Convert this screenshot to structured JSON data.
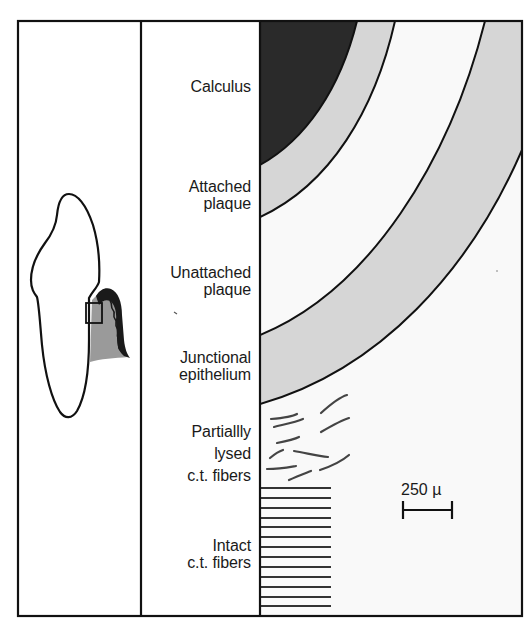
{
  "figure": {
    "layers": [
      {
        "id": "calculus",
        "lines": [
          "Calculus"
        ]
      },
      {
        "id": "attached-plaque",
        "lines": [
          "Attached",
          "plaque"
        ]
      },
      {
        "id": "unattached-plaque",
        "lines": [
          "Unattached",
          "plaque"
        ]
      },
      {
        "id": "junctional-epithelium",
        "lines": [
          "Junctional",
          "epithelium"
        ]
      },
      {
        "id": "partially-lysed-ct-fibers",
        "lines": [
          "Partiallly",
          "lysed",
          "c.t. fibers"
        ]
      },
      {
        "id": "intact-ct-fibers",
        "lines": [
          "Intact",
          "c.t. fibers"
        ]
      }
    ],
    "scale_bar": {
      "label": "250 µ"
    },
    "colors": {
      "calculus": "#2a2a2a",
      "plaque_gray": "#d6d6d6",
      "background": "#f9f9f9",
      "line": "#111111",
      "gingiva_gray": "#9a9a9a"
    }
  }
}
